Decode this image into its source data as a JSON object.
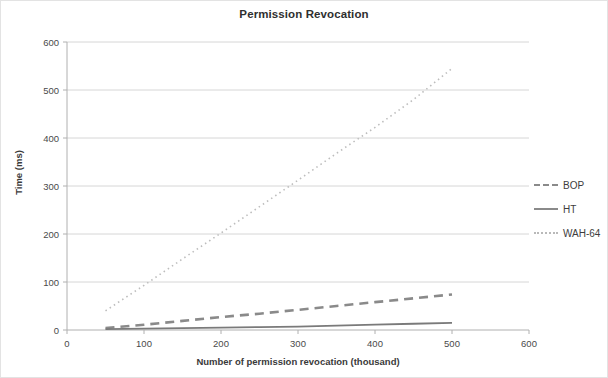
{
  "chart_data": {
    "type": "line",
    "title": "Permission Revocation",
    "xlabel": "Number of permission revocation (thousand)",
    "ylabel": "Time (ms)",
    "xlim": [
      0,
      600
    ],
    "ylim": [
      0,
      600
    ],
    "xticks": [
      0,
      100,
      200,
      300,
      400,
      500,
      600
    ],
    "yticks": [
      0,
      100,
      200,
      300,
      400,
      500,
      600
    ],
    "grid": "horizontal",
    "legend_position": "right",
    "x": [
      50,
      100,
      150,
      200,
      250,
      300,
      350,
      400,
      450,
      500
    ],
    "series": [
      {
        "name": "BOP",
        "style": "dashed",
        "color": "#8a8a8a",
        "values": [
          4,
          11,
          19,
          27,
          34,
          42,
          50,
          58,
          66,
          74
        ]
      },
      {
        "name": "HT",
        "style": "solid",
        "color": "#7a7a7a",
        "values": [
          2,
          3,
          4,
          5,
          6,
          7,
          9,
          11,
          13,
          15
        ]
      },
      {
        "name": "WAH-64",
        "style": "dotted",
        "color": "#bdbdbd",
        "values": [
          40,
          93,
          148,
          202,
          257,
          312,
          368,
          422,
          480,
          545
        ]
      }
    ]
  },
  "legend": {
    "items": [
      {
        "label": "BOP"
      },
      {
        "label": "HT"
      },
      {
        "label": "WAH-64"
      }
    ]
  },
  "colors": {
    "bop": "#8a8a8a",
    "ht": "#7a7a7a",
    "wah64": "#bdbdbd",
    "gridline": "#d6d6d6",
    "axis": "#b0b0b0",
    "frame_border": "#e3e3e3",
    "text": "#3d3d3d"
  }
}
